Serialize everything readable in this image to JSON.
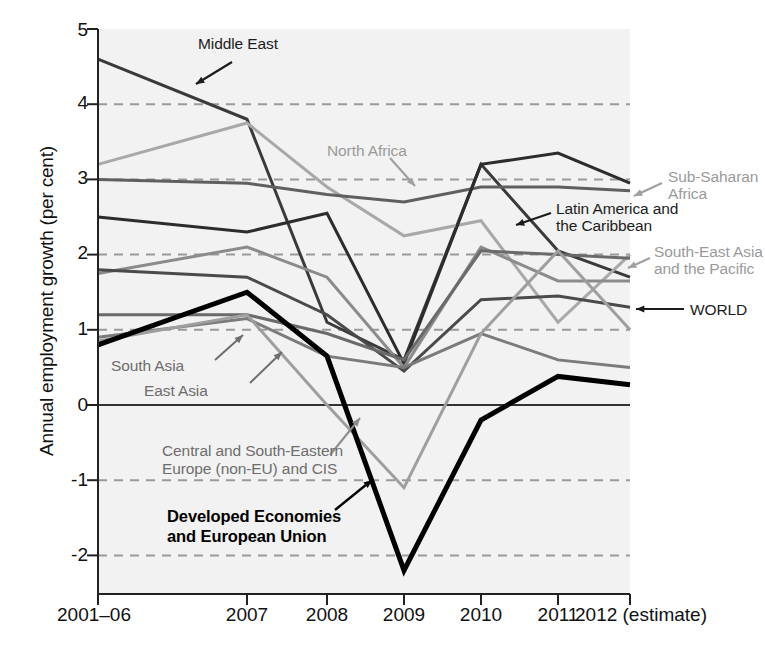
{
  "figure": {
    "y_axis_title": "Annual employment growth (per cent)",
    "caption": ""
  },
  "chart_data": {
    "type": "line",
    "title": "",
    "xlabel": "",
    "ylabel": "Annual employment growth (per cent)",
    "categories": [
      "2001–06",
      "2007",
      "2008",
      "2009",
      "2010",
      "2011",
      "2012 (estimate)"
    ],
    "x_tick_labels": [
      "2001–06",
      "2007",
      "2008",
      "2009",
      "2010",
      "2011",
      "2012 (estimate)"
    ],
    "y_tick_labels": [
      "5",
      "4",
      "3",
      "2",
      "1",
      "0",
      "-1",
      "-2"
    ],
    "y_ticks": [
      5,
      4,
      3,
      2,
      1,
      0,
      -1,
      -2
    ],
    "ylim": [
      -2.55,
      5.0
    ],
    "grid": "horizontal-dashed-at-4-3-2-1-minus1-minus2",
    "zero_line": true,
    "legend": "inline-annotations",
    "series": [
      {
        "name": "Middle East",
        "color": "#3a3a3a",
        "width": 3.0,
        "values": [
          4.6,
          3.8,
          1.1,
          0.6,
          3.2,
          2.05,
          1.7
        ]
      },
      {
        "name": "North Africa",
        "color": "#a8a8a8",
        "width": 3.0,
        "values": [
          3.2,
          3.75,
          2.9,
          2.25,
          2.45,
          1.1,
          2.0
        ]
      },
      {
        "name": "Sub-Saharan Africa",
        "color": "#5f5f5f",
        "width": 3.0,
        "values": [
          3.0,
          2.95,
          2.8,
          2.7,
          2.9,
          2.9,
          2.85
        ]
      },
      {
        "name": "Latin America and the Caribbean",
        "color": "#2c2c2c",
        "width": 3.0,
        "values": [
          2.5,
          2.3,
          2.55,
          0.55,
          3.2,
          3.35,
          2.95
        ]
      },
      {
        "name": "South-East Asia and the Pacific",
        "color": "#8b8b8b",
        "width": 3.0,
        "values": [
          1.75,
          2.1,
          1.7,
          0.5,
          2.1,
          1.65,
          1.65
        ]
      },
      {
        "name": "WORLD",
        "color": "#4a4a4a",
        "width": 3.0,
        "values": [
          1.8,
          1.7,
          1.2,
          0.45,
          1.4,
          1.45,
          1.3
        ]
      },
      {
        "name": "South Asia",
        "color": "#6a6a6a",
        "width": 3.0,
        "values": [
          1.2,
          1.2,
          0.95,
          0.6,
          2.05,
          2.0,
          1.95
        ]
      },
      {
        "name": "East Asia",
        "color": "#7b7b7b",
        "width": 3.0,
        "values": [
          0.9,
          1.15,
          0.65,
          0.5,
          0.95,
          0.6,
          0.5
        ]
      },
      {
        "name": "Central and South-Eastern Europe (non-EU) and CIS",
        "color": "#9e9e9e",
        "width": 3.0,
        "values": [
          0.85,
          1.2,
          0.0,
          -1.1,
          0.95,
          2.05,
          1.0
        ]
      },
      {
        "name": "Developed Economies and European Union",
        "color": "#000000",
        "width": 5.0,
        "values": [
          0.8,
          1.5,
          0.65,
          -2.2,
          -0.2,
          0.38,
          0.27
        ]
      }
    ],
    "annotations": [
      {
        "text": "Middle East",
        "style": "dark",
        "target_series": "Middle East"
      },
      {
        "text": "North Africa",
        "style": "light",
        "target_series": "North Africa"
      },
      {
        "text": "Sub-Saharan\nAfrica",
        "style": "light",
        "target_series": "Sub-Saharan Africa"
      },
      {
        "text": "Latin America and\nthe Caribbean",
        "style": "dark",
        "target_series": "Latin America and the Caribbean"
      },
      {
        "text": "South-East Asia\nand the Pacific",
        "style": "light",
        "target_series": "South-East Asia and the Pacific"
      },
      {
        "text": "WORLD",
        "style": "dark",
        "target_series": "WORLD"
      },
      {
        "text": "South Asia",
        "style": "mid",
        "target_series": "South Asia"
      },
      {
        "text": "East Asia",
        "style": "mid",
        "target_series": "East Asia"
      },
      {
        "text": "Central and South-Eastern\nEurope (non-EU) and CIS",
        "style": "mid",
        "target_series": "Central and South-Eastern Europe (non-EU) and CIS"
      },
      {
        "text": "Developed Economies\nand European Union",
        "style": "bold",
        "target_series": "Developed Economies and European Union"
      }
    ]
  },
  "ticks": {
    "y": [
      {
        "label": "5"
      },
      {
        "label": "4"
      },
      {
        "label": "3"
      },
      {
        "label": "2"
      },
      {
        "label": "1"
      },
      {
        "label": "0"
      },
      {
        "label": "-1"
      },
      {
        "label": "-2"
      }
    ],
    "x": [
      {
        "label": "2001–06"
      },
      {
        "label": "2007"
      },
      {
        "label": "2008"
      },
      {
        "label": "2009"
      },
      {
        "label": "2010"
      },
      {
        "label": "2011"
      },
      {
        "label": "2012 (estimate)"
      }
    ]
  },
  "annotation_text": {
    "middle_east": "Middle East",
    "north_africa": "North Africa",
    "sub_saharan_africa_l1": "Sub-Saharan",
    "sub_saharan_africa_l2": "Africa",
    "latin_america_l1": "Latin America and",
    "latin_america_l2": "the Caribbean",
    "sea_pacific_l1": "South-East Asia",
    "sea_pacific_l2": "and the Pacific",
    "world": "WORLD",
    "south_asia": "South Asia",
    "east_asia": "East Asia",
    "cseecis_l1": "Central and South-Eastern",
    "cseecis_l2": "Europe (non-EU) and CIS",
    "developed_l1": "Developed Economies",
    "developed_l2": "and European Union"
  },
  "colors": {
    "plot_background": "#f2f2f2",
    "axis": "#222222",
    "gridline": "#9a9a9a",
    "zero_line": "#333333"
  }
}
